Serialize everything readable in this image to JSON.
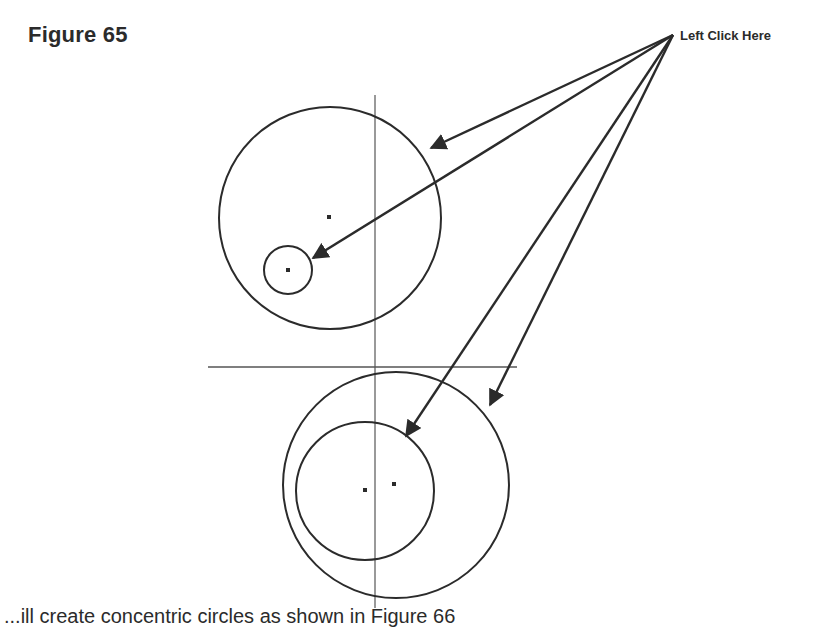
{
  "figure": {
    "title": "Figure 65",
    "callout_label": "Left Click Here",
    "caption_partial": "...ill create concentric circles as shown in Figure 66"
  },
  "colors": {
    "ink": "#2b2b2b",
    "construction_line": "#555555",
    "background": "#ffffff"
  },
  "geometry": {
    "vertical_axis": {
      "x": 375,
      "y1": 95,
      "y2": 608
    },
    "horizontal_axis": {
      "y": 367,
      "x1": 208,
      "x2": 517
    },
    "upper_large_circle": {
      "cx": 330,
      "cy": 218,
      "r": 111
    },
    "upper_small_circle": {
      "cx": 288,
      "cy": 270,
      "r": 24
    },
    "lower_outer_circle": {
      "cx": 396,
      "cy": 485,
      "r": 113
    },
    "lower_inner_circle": {
      "cx": 365,
      "cy": 491,
      "r": 69
    },
    "arrow_origin": {
      "x": 673,
      "y": 35
    },
    "arrow_tips": [
      {
        "target": "upper-large-circle",
        "x": 431,
        "y": 148
      },
      {
        "target": "upper-small-circle",
        "x": 313,
        "y": 258
      },
      {
        "target": "lower-inner-circle",
        "x": 406,
        "y": 436
      },
      {
        "target": "lower-outer-circle",
        "x": 490,
        "y": 405
      }
    ]
  }
}
